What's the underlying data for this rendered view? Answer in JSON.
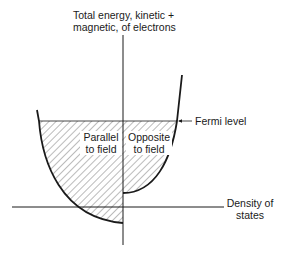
{
  "figure": {
    "y_axis_label_line1": "Total energy, kinetic +",
    "y_axis_label_line2": "magnetic, of electrons",
    "x_axis_label_line1": "Density of",
    "x_axis_label_line2": "states",
    "fermi_label": "Fermi level",
    "left_band_label_line1": "Parallel",
    "left_band_label_line2": "to field",
    "right_band_label_line1": "Opposite",
    "right_band_label_line2": "to field"
  },
  "colors": {
    "line": "#1a1a1a",
    "hatch": "#555555",
    "background": "#ffffff"
  }
}
